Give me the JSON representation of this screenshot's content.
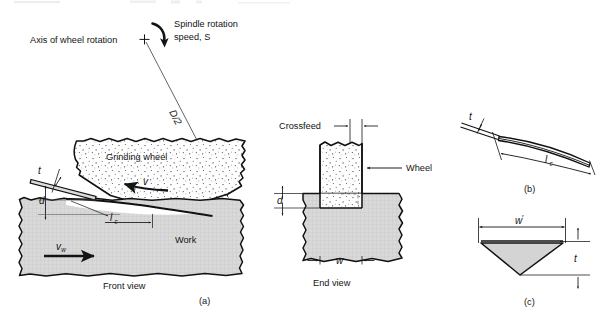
{
  "figure": {
    "title_fragment": "",
    "background_color": "#ffffff",
    "ink_color": "#141414",
    "wheel_fill": "#fdfdfd",
    "work_fill": "#d6d6d6",
    "chip_fill": "#d0d0d0"
  },
  "front_view": {
    "caption": "Front view",
    "part_label": "(a)",
    "wheel_label": "Grinding wheel",
    "work_label": "Work",
    "axis_label": "Axis of wheel rotation",
    "axis_marker": "+",
    "spindle_label_line1": "Spindle rotation",
    "spindle_label_line2": "speed, S",
    "radius_label": "D/2",
    "chip_thickness_label": "t",
    "depth_label": "d",
    "contact_length_label": "l",
    "contact_length_sub": "c",
    "wheel_speed_label": "v",
    "work_speed_label": "v",
    "work_speed_sub": "w"
  },
  "end_view": {
    "caption": "End view",
    "crossfeed_label": "Crossfeed",
    "wheel_label": "Wheel",
    "depth_label": "d",
    "width_label": "w"
  },
  "chip_side_view": {
    "part_label": "(b)",
    "thickness_label": "t",
    "contact_length_label": "l",
    "contact_length_sub": "c"
  },
  "chip_cross_section": {
    "part_label": "(c)",
    "width_label": "w",
    "width_prime": "′",
    "thickness_label": "t"
  }
}
